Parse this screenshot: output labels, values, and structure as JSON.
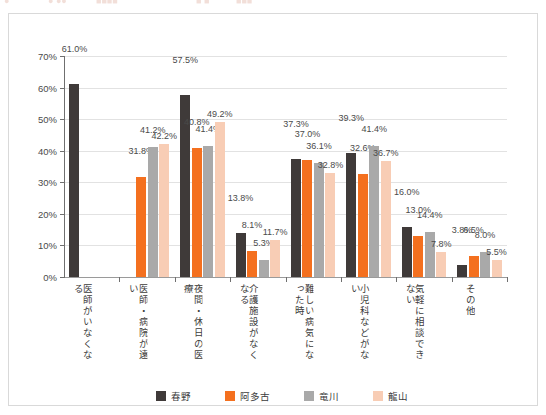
{
  "top_strip": {
    "ghost_fragments": [
      "●",
      "● ●●",
      "■■■■",
      "■ ■",
      "■■■"
    ]
  },
  "legend": {
    "position": "bottom-center",
    "items": [
      {
        "label": "春野",
        "color": "#3f3a39"
      },
      {
        "label": "阿多古",
        "color": "#f4701f"
      },
      {
        "label": "竜川",
        "color": "#a9a9a9"
      },
      {
        "label": "龍山",
        "color": "#f8cdb5"
      }
    ]
  },
  "chart_data": {
    "type": "bar",
    "title": "",
    "xlabel": "",
    "ylabel": "",
    "ylim": [
      0,
      70
    ],
    "ytick_labels": [
      "0%",
      "10%",
      "20%",
      "30%",
      "40%",
      "50%",
      "60%",
      "70%"
    ],
    "ytick_values": [
      0,
      10,
      20,
      30,
      40,
      50,
      60,
      70
    ],
    "grid": true,
    "legend_position": "bottom",
    "value_label_suffix": "%",
    "categories": [
      "医師がいなくなる",
      "医師・病院が遠い",
      "夜間・休日の医療",
      "介護施設がなくなる",
      "難しい病気になった時",
      "小児科などがない",
      "気軽に相談できない",
      "その他"
    ],
    "series": [
      {
        "name": "春野",
        "color": "#3f3a39",
        "values": [
          61.0,
          null,
          57.5,
          13.8,
          37.3,
          39.3,
          16.0,
          3.8
        ],
        "labels": [
          "61.0%",
          "",
          "57.5%",
          "13.8%",
          "37.3%",
          "39.3%",
          "16.0%",
          "3.8%"
        ]
      },
      {
        "name": "阿多古",
        "color": "#f4701f",
        "values": [
          null,
          31.8,
          40.8,
          8.1,
          37.0,
          32.6,
          13.0,
          6.5
        ],
        "labels": [
          "",
          "31.8%",
          "40.8%",
          "8.1%",
          "37.0%",
          "32.6%",
          "13.0%",
          "6.5%"
        ]
      },
      {
        "name": "竜川",
        "color": "#a9a9a9",
        "values": [
          null,
          41.2,
          41.4,
          5.3,
          36.1,
          41.4,
          14.4,
          8.0
        ],
        "labels": [
          "",
          "41.2%",
          "41.4%",
          "5.3%",
          "36.1%",
          "41.4%",
          "14.4%",
          "8.0%"
        ]
      },
      {
        "name": "龍山",
        "color": "#f8cdb5",
        "values": [
          null,
          42.2,
          49.2,
          11.7,
          32.8,
          36.7,
          7.8,
          5.5
        ],
        "labels": [
          "",
          "42.2%",
          "49.2%",
          "11.7%",
          "32.8%",
          "36.7%",
          "7.8%",
          "5.5%"
        ]
      }
    ]
  }
}
